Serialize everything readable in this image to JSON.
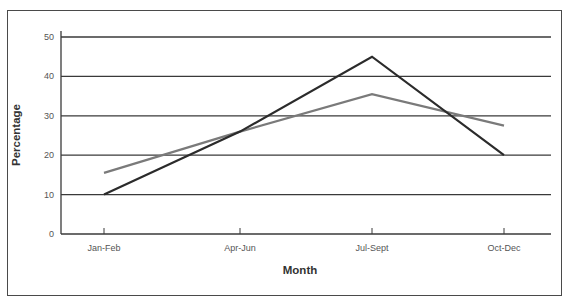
{
  "chart_data": {
    "type": "line",
    "title": "",
    "xlabel": "Month",
    "ylabel": "Percentage",
    "categories": [
      "Jan-Feb",
      "Apr-Jun",
      "Jul-Sept",
      "Oct-Dec"
    ],
    "series": [
      {
        "name": "Series A (dark)",
        "color": "#2b2b2b",
        "values": [
          10,
          26,
          45,
          20
        ]
      },
      {
        "name": "Series B (gray)",
        "color": "#7a7a7a",
        "values": [
          15.5,
          26,
          35.5,
          27.5
        ]
      }
    ],
    "yticks": [
      0,
      10,
      20,
      30,
      40,
      50
    ],
    "ylim": [
      0,
      50
    ],
    "grid": true,
    "legend": "none"
  }
}
